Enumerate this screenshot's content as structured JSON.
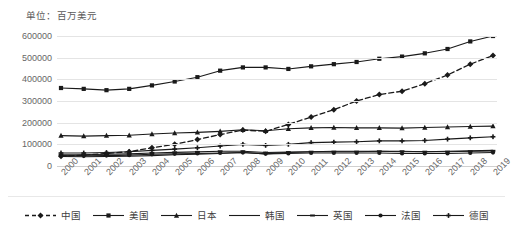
{
  "chart": {
    "unit_title": "单位：百万美元"
  },
  "chart_data": {
    "type": "line",
    "title": "单位：百万美元",
    "xlabel": "",
    "ylabel": "",
    "ylim": [
      0,
      600000
    ],
    "ytick_step": 100000,
    "grid": true,
    "legend_position": "bottom",
    "yticks": [
      "0",
      "100000",
      "200000",
      "300000",
      "400000",
      "500000",
      "600000"
    ],
    "categories": [
      "2000",
      "2001",
      "2002",
      "2003",
      "2004",
      "2005",
      "2006",
      "2007",
      "2008",
      "2009",
      "2010",
      "2011",
      "2012",
      "2013",
      "2014",
      "2015",
      "2016",
      "2017",
      "2018",
      "2019"
    ],
    "series": [
      {
        "name": "中国",
        "style": "dashed",
        "marker": "diamond",
        "color": "#1a1a1a",
        "values": [
          45000,
          50000,
          58000,
          66000,
          84000,
          100000,
          122000,
          145000,
          166000,
          160000,
          192000,
          226000,
          260000,
          300000,
          330000,
          345000,
          380000,
          420000,
          470000,
          510000
        ]
      },
      {
        "name": "美国",
        "style": "solid",
        "marker": "square",
        "color": "#1a1a1a",
        "values": [
          360000,
          356000,
          350000,
          356000,
          372000,
          390000,
          410000,
          440000,
          455000,
          455000,
          448000,
          460000,
          470000,
          480000,
          495000,
          505000,
          520000,
          540000,
          575000,
          600000
        ]
      },
      {
        "name": "日本",
        "style": "solid",
        "marker": "triangle",
        "color": "#1a1a1a",
        "values": [
          140000,
          138000,
          140000,
          142000,
          148000,
          152000,
          155000,
          160000,
          167000,
          163000,
          172000,
          176000,
          178000,
          176000,
          176000,
          175000,
          178000,
          180000,
          182000,
          184000
        ]
      },
      {
        "name": "韩国",
        "style": "solid",
        "marker": "none",
        "color": "#1a1a1a",
        "values": [
          44000,
          43000,
          44000,
          45000,
          48000,
          52000,
          55000,
          58000,
          62000,
          56000,
          62000,
          66000,
          68000,
          68000,
          68000,
          66000,
          66000,
          68000,
          70000,
          72000
        ]
      },
      {
        "name": "英国",
        "style": "solid",
        "marker": "dash",
        "color": "#1a1a1a",
        "values": [
          52000,
          52000,
          54000,
          56000,
          60000,
          63000,
          65000,
          68000,
          68000,
          62000,
          64000,
          66000,
          66000,
          66000,
          68000,
          68000,
          66000,
          66000,
          68000,
          70000
        ]
      },
      {
        "name": "法国",
        "style": "solid",
        "marker": "circle",
        "color": "#1a1a1a",
        "values": [
          48000,
          47000,
          48000,
          50000,
          54000,
          56000,
          58000,
          60000,
          62000,
          56000,
          58000,
          60000,
          60000,
          60000,
          60000,
          58000,
          58000,
          58000,
          60000,
          62000
        ]
      },
      {
        "name": "德国",
        "style": "solid",
        "marker": "plus",
        "color": "#1a1a1a",
        "values": [
          60000,
          60000,
          62000,
          66000,
          72000,
          78000,
          84000,
          92000,
          100000,
          95000,
          100000,
          108000,
          110000,
          112000,
          116000,
          116000,
          118000,
          124000,
          130000,
          135000
        ]
      }
    ]
  }
}
